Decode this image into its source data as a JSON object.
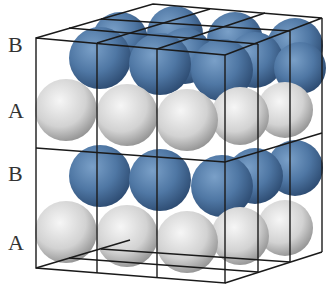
{
  "diagram": {
    "type": "crystal-packing",
    "layer_labels": [
      {
        "label": "B",
        "y": 34
      },
      {
        "label": "A",
        "y": 100
      },
      {
        "label": "B",
        "y": 163
      },
      {
        "label": "A",
        "y": 232
      }
    ],
    "colors": {
      "layer_A": "#d8d8d8",
      "layer_B": "#4f77a4",
      "frame": "#1a1a1a",
      "label": "#333333"
    },
    "caption": ""
  }
}
